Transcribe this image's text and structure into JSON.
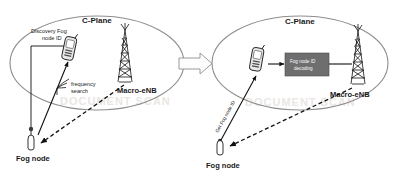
{
  "figure": {
    "panels": [
      {
        "id": "left-panel",
        "plane_label": "C-Plane",
        "annotations": {
          "discovery_label": "Discovery Fog node ID",
          "discovery_label_line1": "Discovery Fog",
          "discovery_label_line2": "node ID",
          "frequency_label_line1": "frequency",
          "frequency_label_line2": "search"
        },
        "nodes": [
          {
            "name": "ue-phone",
            "icon": "mobile-phone-icon",
            "label": ""
          },
          {
            "name": "macro-enb-tower",
            "icon": "cell-tower-icon",
            "label": "Macro-eNB"
          },
          {
            "name": "fog-node",
            "icon": "fog-node-icon",
            "label": "Fog node"
          }
        ]
      },
      {
        "id": "right-panel",
        "plane_label": "C-Plane",
        "annotations": {
          "decoding_box_line1": "Fog node ID",
          "decoding_box_line2": "decoding",
          "get_fog_node_id_label": "Get Fog node ID"
        },
        "nodes": [
          {
            "name": "ue-phone",
            "icon": "mobile-phone-icon",
            "label": ""
          },
          {
            "name": "macro-enb-tower",
            "icon": "cell-tower-icon",
            "label": "Macro-eNB"
          },
          {
            "name": "fog-node",
            "icon": "fog-node-icon",
            "label": "Fog node"
          }
        ]
      }
    ],
    "transition": {
      "name": "block-arrow",
      "direction": "right"
    },
    "colors": {
      "ellipse_stroke": "#8d8d8d",
      "decoding_box_fill": "#6e6e6e",
      "line": "#111111",
      "text": "#1a1a1a",
      "background": "#ffffff"
    },
    "watermark_text": "DOCUMENT SCAN"
  }
}
